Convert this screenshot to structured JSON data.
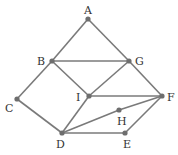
{
  "graph": {
    "nodes": [
      {
        "id": "A",
        "x": 88,
        "y": 19,
        "lx": 84,
        "ly": 14
      },
      {
        "id": "B",
        "x": 52,
        "y": 61,
        "lx": 37,
        "ly": 65
      },
      {
        "id": "G",
        "x": 129,
        "y": 61,
        "lx": 135,
        "ly": 65
      },
      {
        "id": "C",
        "x": 17,
        "y": 99,
        "lx": 5,
        "ly": 112
      },
      {
        "id": "I",
        "x": 89,
        "y": 96,
        "lx": 76,
        "ly": 101
      },
      {
        "id": "F",
        "x": 162,
        "y": 96,
        "lx": 167,
        "ly": 101
      },
      {
        "id": "H",
        "x": 119,
        "y": 110,
        "lx": 117,
        "ly": 125
      },
      {
        "id": "D",
        "x": 62,
        "y": 133,
        "lx": 56,
        "ly": 148
      },
      {
        "id": "E",
        "x": 125,
        "y": 133,
        "lx": 123,
        "ly": 148
      }
    ],
    "edges": [
      [
        "A",
        "B"
      ],
      [
        "A",
        "G"
      ],
      [
        "B",
        "G"
      ],
      [
        "B",
        "C"
      ],
      [
        "B",
        "I"
      ],
      [
        "G",
        "I"
      ],
      [
        "G",
        "F"
      ],
      [
        "C",
        "D"
      ],
      [
        "I",
        "D"
      ],
      [
        "I",
        "F"
      ],
      [
        "D",
        "H"
      ],
      [
        "H",
        "F"
      ],
      [
        "D",
        "E"
      ],
      [
        "E",
        "F"
      ]
    ],
    "edge_color": "#7a7a7a",
    "node_color": "#6e6e6e"
  }
}
